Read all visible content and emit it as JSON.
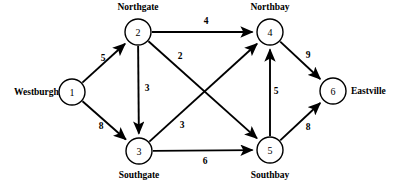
{
  "diagram": {
    "stroke_color": "#000000",
    "background_color": "#ffffff",
    "nodes": [
      {
        "id": "1",
        "number": "1",
        "label": "Westburgh",
        "cx": 72,
        "cy": 92,
        "r": 13,
        "label_x": 14,
        "label_y": 92,
        "label_anchor": "start"
      },
      {
        "id": "2",
        "number": "2",
        "label": "Northgate",
        "cx": 138,
        "cy": 32,
        "r": 13,
        "label_x": 138,
        "label_y": 7,
        "label_anchor": "middle"
      },
      {
        "id": "3",
        "number": "3",
        "label": "Southgate",
        "cx": 139,
        "cy": 151,
        "r": 13,
        "label_x": 139,
        "label_y": 175,
        "label_anchor": "middle"
      },
      {
        "id": "4",
        "number": "4",
        "label": "Northbay",
        "cx": 270,
        "cy": 32,
        "r": 13,
        "label_x": 270,
        "label_y": 7,
        "label_anchor": "middle"
      },
      {
        "id": "5",
        "number": "5",
        "label": "Southbay",
        "cx": 270,
        "cy": 150,
        "r": 13,
        "label_x": 270,
        "label_y": 175,
        "label_anchor": "middle"
      },
      {
        "id": "6",
        "number": "6",
        "label": "Eastville",
        "cx": 333,
        "cy": 91,
        "r": 13,
        "label_x": 351,
        "label_y": 91,
        "label_anchor": "start"
      }
    ],
    "edges": [
      {
        "id": "e1-2",
        "from": "1",
        "to": "2",
        "weight": "5",
        "label_x": 103,
        "label_y": 58
      },
      {
        "id": "e1-3",
        "from": "1",
        "to": "3",
        "weight": "8",
        "label_x": 101,
        "label_y": 126
      },
      {
        "id": "e2-4",
        "from": "2",
        "to": "4",
        "weight": "4",
        "label_x": 206,
        "label_y": 21
      },
      {
        "id": "e2-3",
        "from": "2",
        "to": "3",
        "weight": "3",
        "label_x": 147,
        "label_y": 88
      },
      {
        "id": "e2-5",
        "from": "2",
        "to": "5",
        "weight": "2",
        "label_x": 180,
        "label_y": 56
      },
      {
        "id": "e3-4",
        "from": "3",
        "to": "4",
        "weight": "3",
        "label_x": 182,
        "label_y": 125
      },
      {
        "id": "e3-5",
        "from": "3",
        "to": "5",
        "weight": "6",
        "label_x": 205,
        "label_y": 161
      },
      {
        "id": "e5-4",
        "from": "5",
        "to": "4",
        "weight": "5",
        "label_x": 276,
        "label_y": 91
      },
      {
        "id": "e4-6",
        "from": "4",
        "to": "6",
        "weight": "9",
        "label_x": 308,
        "label_y": 55
      },
      {
        "id": "e5-6",
        "from": "5",
        "to": "6",
        "weight": "8",
        "label_x": 308,
        "label_y": 127
      }
    ]
  }
}
